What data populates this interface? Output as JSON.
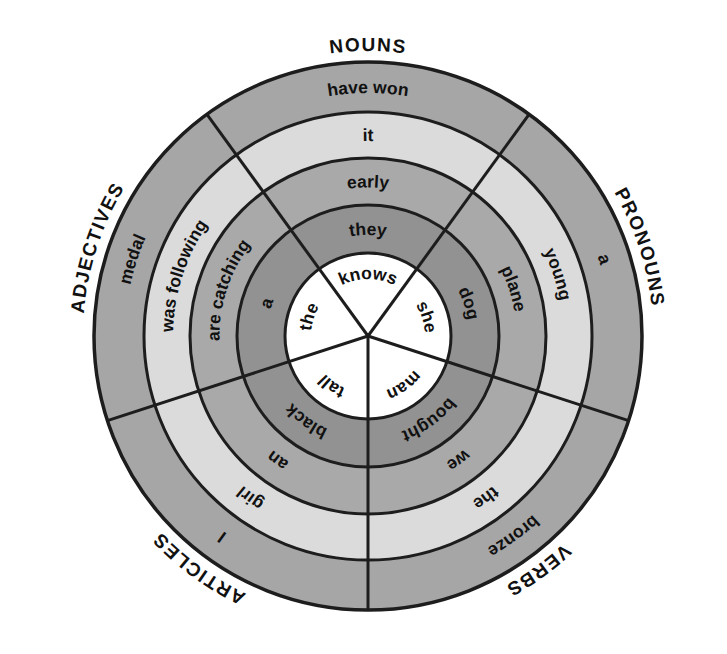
{
  "diagram": {
    "name": "parts-of-speech-word-wheel",
    "background_color": "#ffffff",
    "stroke_color": "#1d1d1d",
    "text_color": "#111111",
    "ring_fills_center_to_outer": [
      "#ffffff",
      "#929292",
      "#a9a9a9",
      "#dbdbdb",
      "#a6a6a6"
    ],
    "sectors": [
      {
        "name": "nouns",
        "label": "NOUNS",
        "mid_angle_deg": 90,
        "words_center_to_outer": [
          "knows",
          "they",
          "early",
          "it",
          "have won"
        ]
      },
      {
        "name": "pronouns",
        "label": "PRONOUNS",
        "mid_angle_deg": 18,
        "words_center_to_outer": [
          "she",
          "dog",
          "plane",
          "young",
          "a"
        ]
      },
      {
        "name": "verbs",
        "label": "VERBS",
        "mid_angle_deg": 306,
        "words_center_to_outer": [
          "man",
          "bought",
          "we",
          "the",
          "bronze"
        ]
      },
      {
        "name": "articles",
        "label": "ARTICLES",
        "mid_angle_deg": 234,
        "words_center_to_outer": [
          "tall",
          "black",
          "an",
          "girl",
          "I"
        ]
      },
      {
        "name": "adjectives",
        "label": "ADJECTIVES",
        "mid_angle_deg": 162,
        "words_center_to_outer": [
          "the",
          "a",
          "are catching",
          "was following",
          "medal"
        ]
      }
    ]
  }
}
